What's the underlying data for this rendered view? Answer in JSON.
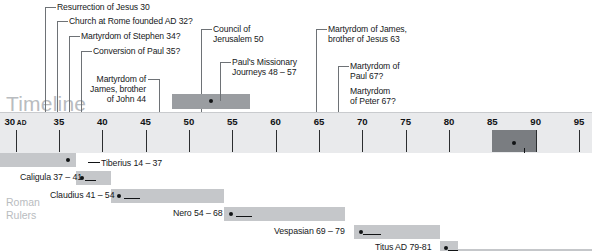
{
  "meta": {
    "watermark_timeline": "Timeline",
    "watermark_rulers_line1": "Roman",
    "watermark_rulers_line2": "Rulers"
  },
  "axis": {
    "start_year": 28.2,
    "end_year": 96.5,
    "ad_suffix": "AD",
    "ticks": [
      {
        "year": 30,
        "label": "30",
        "ad": true
      },
      {
        "year": 35,
        "label": "35",
        "ad": false
      },
      {
        "year": 40,
        "label": "40",
        "ad": false
      },
      {
        "year": 45,
        "label": "45",
        "ad": false
      },
      {
        "year": 50,
        "label": "50",
        "ad": false
      },
      {
        "year": 55,
        "label": "55",
        "ad": false
      },
      {
        "year": 60,
        "label": "60",
        "ad": false
      },
      {
        "year": 65,
        "label": "65",
        "ad": false
      },
      {
        "year": 70,
        "label": "70",
        "ad": false
      },
      {
        "year": 75,
        "label": "75",
        "ad": false
      },
      {
        "year": 80,
        "label": "80",
        "ad": false
      },
      {
        "year": 85,
        "label": "85",
        "ad": false
      },
      {
        "year": 90,
        "label": "90",
        "ad": false
      },
      {
        "year": 95,
        "label": "95",
        "ad": false
      }
    ]
  },
  "events": [
    {
      "id": "resurrection",
      "text": "Resurrection of Jesus 30",
      "year": 30,
      "label_x": 57,
      "label_y": 2,
      "stub_x": 45,
      "stub_w": 11,
      "stub_y": 7,
      "line_x": 45,
      "line_top": 7,
      "line_bottom": 112
    },
    {
      "id": "church-rome",
      "text": "Church at Rome founded AD 32?",
      "year": 32,
      "label_x": 69,
      "label_y": 16,
      "stub_x": 57,
      "stub_w": 11,
      "stub_y": 21,
      "line_x": 57,
      "line_top": 21,
      "line_bottom": 112
    },
    {
      "id": "stephen",
      "text": "Martyrdom of Stephen 34?",
      "year": 34,
      "label_x": 81,
      "label_y": 31,
      "stub_x": 69,
      "stub_w": 11,
      "stub_y": 36,
      "line_x": 69,
      "line_top": 36,
      "line_bottom": 112
    },
    {
      "id": "conversion-paul",
      "text": "Conversion of Paul 35?",
      "year": 35,
      "label_x": 93,
      "label_y": 46,
      "stub_x": 81,
      "stub_w": 11,
      "stub_y": 51,
      "line_x": 81,
      "line_top": 51,
      "line_bottom": 112
    },
    {
      "id": "james-john",
      "text": "Martyrdom of\nJames, brother\nof John 44",
      "year": 44,
      "label_x": 76,
      "label_y": 74,
      "label_w": 70,
      "align": "right",
      "stub_x": 148,
      "stub_w": 11,
      "stub_y": 79,
      "line_x": 159,
      "line_top": 79,
      "line_bottom": 112
    },
    {
      "id": "council-jerusalem",
      "text": "Council of\nJerusalem 50",
      "year": 50,
      "label_x": 213,
      "label_y": 24,
      "stub_x": 201,
      "stub_w": 11,
      "stub_y": 29,
      "line_x": 201,
      "line_top": 29,
      "line_bottom": 112
    },
    {
      "id": "paul-journeys",
      "text": "Paul's Missionary\nJourneys 48 – 57",
      "year": 52.5,
      "label_x": 232,
      "label_y": 57,
      "stub_x": 220,
      "stub_w": 11,
      "stub_y": 62,
      "line_x": 220,
      "line_top": 62,
      "line_bottom": 101,
      "bar": {
        "start": 48,
        "end": 57,
        "top": 94,
        "height": 15
      },
      "dot": {
        "year": 52.5,
        "y": 101
      }
    },
    {
      "id": "james-jesus",
      "text": "Martyrdom of James,\nbrother of Jesus 63",
      "year": 63,
      "label_x": 328,
      "label_y": 24,
      "stub_x": 316,
      "stub_w": 11,
      "stub_y": 29,
      "line_x": 316,
      "line_top": 29,
      "line_bottom": 112
    },
    {
      "id": "martyrdom-paul",
      "text": "Martyrdom of\nPaul 67?",
      "year": 67,
      "label_x": 350,
      "label_y": 61,
      "stub_x": 338,
      "stub_w": 11,
      "stub_y": 66,
      "line_x": 338,
      "line_top": 66,
      "line_bottom": 112
    },
    {
      "id": "martyrdom-peter",
      "text": "Martyrdom\nof Peter 67?",
      "year": 67,
      "label_x": 350,
      "label_y": 86
    }
  ],
  "highlight": {
    "id": "first-john",
    "text": "1 John written AD 85 – 90",
    "start": 85,
    "end": 90,
    "bar_top": 130,
    "bar_height": 22,
    "dot_year": 87.5,
    "dot_y": 143,
    "label_x": 390,
    "label_y": 158,
    "connector_x": 506,
    "connector_w": 18,
    "connector_y": 162,
    "elbow_x": 524,
    "elbow_top": 148,
    "elbow_bottom": 162
  },
  "rulers": [
    {
      "id": "tiberius",
      "name": "Tiberius 14 – 37",
      "start": 28.2,
      "end": 37,
      "row_top": 153,
      "label_x": 101,
      "label_y": 158,
      "dot_year": 36.1,
      "dot_y": 160,
      "connector_x": 88,
      "connector_w": 12,
      "connector_y": 162
    },
    {
      "id": "caligula",
      "name": "Caligula 37 – 41",
      "start": 37,
      "end": 41,
      "row_top": 171,
      "label_x": 20,
      "label_y": 172,
      "dot_year": 37.7,
      "dot_y": 178,
      "connector_x": 85,
      "connector_w": 11,
      "connector_y": 180
    },
    {
      "id": "claudius",
      "name": "Claudius 41 – 54",
      "start": 41,
      "end": 54,
      "row_top": 189,
      "label_x": 50,
      "label_y": 190,
      "dot_year": 41.9,
      "dot_y": 196,
      "connector_x": 124,
      "connector_w": 16,
      "connector_y": 198
    },
    {
      "id": "nero",
      "name": "Nero 54 – 68",
      "start": 54,
      "end": 68,
      "row_top": 207,
      "label_x": 173,
      "label_y": 208,
      "dot_year": 54.9,
      "dot_y": 214,
      "connector_x": 236,
      "connector_w": 16,
      "connector_y": 216
    },
    {
      "id": "vespasian",
      "name": "Vespasian 69 – 79",
      "start": 69,
      "end": 79,
      "row_top": 225,
      "label_x": 274,
      "label_y": 226,
      "dot_year": 69.9,
      "dot_y": 232,
      "connector_x": 363,
      "connector_w": 18,
      "connector_y": 234
    },
    {
      "id": "titus",
      "name": "Titus AD 79-81",
      "start": 79,
      "end": 81,
      "row_top": 241,
      "label_x": 375,
      "label_y": 242,
      "dot_year": 79.7,
      "dot_y": 248,
      "connector_x": 448,
      "connector_w": 16,
      "connector_y": 250
    },
    {
      "id": "domitian",
      "name": "",
      "start": 81,
      "end": 96.5,
      "row_top": 249
    }
  ],
  "colors": {
    "axis_band": "#e9eaec",
    "event_bar": "#9a9da1",
    "highlight_bar": "#7a7d81",
    "ruler_bar": "#c5c7ca",
    "watermark": "#b9bcc0",
    "text": "#16181a",
    "leader_line": "#6e7276"
  }
}
